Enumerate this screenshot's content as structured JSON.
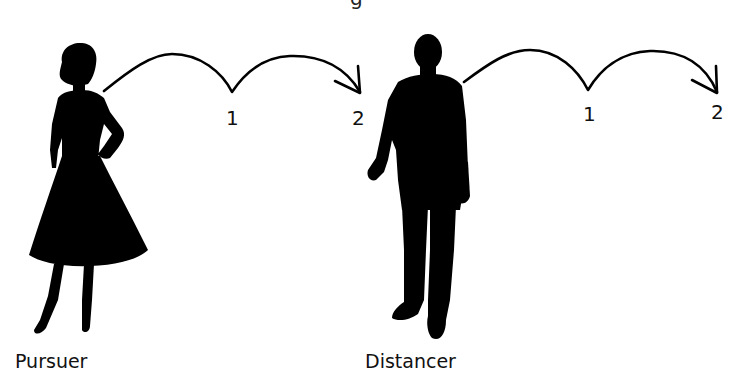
{
  "diagram": {
    "top_fragment": "g",
    "figures": [
      {
        "role": "pursuer",
        "label": "Pursuer",
        "silhouette": "woman-silhouette-icon"
      },
      {
        "role": "distancer",
        "label": "Distancer",
        "silhouette": "man-silhouette-icon"
      }
    ],
    "sequences": [
      {
        "from": "Pursuer",
        "steps": [
          "1",
          "2"
        ],
        "arrow": "double-arc-arrow"
      },
      {
        "from": "Distancer",
        "steps": [
          "1",
          "2"
        ],
        "arrow": "double-arc-arrow"
      }
    ],
    "colors": {
      "ink": "#000000",
      "background": "#ffffff"
    }
  }
}
